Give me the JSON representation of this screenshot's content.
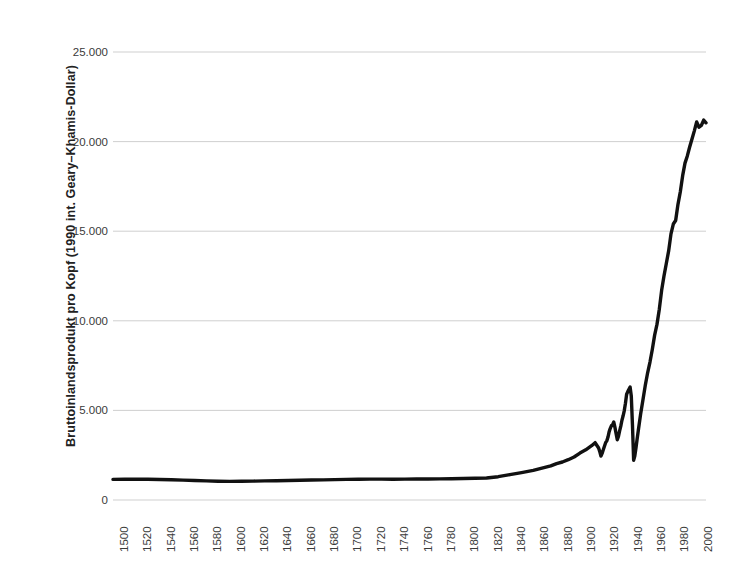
{
  "chart_data": {
    "type": "line",
    "title": "",
    "subtitle": "",
    "xlabel": "",
    "ylabel": "Bruttoinlandsprodukt pro Kopf (1990 int. Geary–Khamis-Dollar)",
    "ylim": [
      0,
      25000
    ],
    "xlim": [
      1500,
      2008
    ],
    "grid": "horizontal",
    "legend": "none",
    "y_tick_labels": [
      "0",
      "5.000",
      "10.000",
      "15.000",
      "20.000",
      "25.000"
    ],
    "y_tick_values": [
      0,
      5000,
      10000,
      15000,
      20000,
      25000
    ],
    "x_tick_labels": [
      "1500",
      "1520",
      "1540",
      "1560",
      "1580",
      "1600",
      "1620",
      "1640",
      "1660",
      "1680",
      "1700",
      "1720",
      "1740",
      "1760",
      "1780",
      "1800",
      "1820",
      "1840",
      "1860",
      "1880",
      "1900",
      "1920",
      "1940",
      "1960",
      "1980",
      "2000"
    ],
    "x_tick_values": [
      1500,
      1520,
      1540,
      1560,
      1580,
      1600,
      1620,
      1640,
      1660,
      1680,
      1700,
      1720,
      1740,
      1760,
      1780,
      1800,
      1820,
      1840,
      1860,
      1880,
      1900,
      1920,
      1940,
      1960,
      1980,
      2000
    ],
    "series": [
      {
        "name": "Bruttoinlandsprodukt pro Kopf",
        "color": "#111111",
        "x": [
          1500,
          1510,
          1520,
          1530,
          1540,
          1550,
          1560,
          1570,
          1580,
          1590,
          1600,
          1610,
          1620,
          1630,
          1640,
          1650,
          1660,
          1670,
          1680,
          1690,
          1700,
          1710,
          1720,
          1730,
          1740,
          1750,
          1760,
          1770,
          1780,
          1790,
          1800,
          1810,
          1820,
          1830,
          1840,
          1850,
          1860,
          1870,
          1875,
          1880,
          1885,
          1890,
          1895,
          1900,
          1905,
          1910,
          1913,
          1914,
          1915,
          1916,
          1917,
          1918,
          1919,
          1920,
          1921,
          1922,
          1923,
          1924,
          1925,
          1926,
          1927,
          1928,
          1929,
          1930,
          1931,
          1932,
          1933,
          1934,
          1935,
          1936,
          1937,
          1938,
          1939,
          1940,
          1941,
          1942,
          1943,
          1944,
          1945,
          1946,
          1947,
          1948,
          1949,
          1950,
          1952,
          1954,
          1956,
          1958,
          1960,
          1962,
          1964,
          1966,
          1968,
          1970,
          1972,
          1974,
          1976,
          1978,
          1980,
          1982,
          1984,
          1986,
          1988,
          1990,
          1992,
          1994,
          1996,
          1998,
          2000,
          2002,
          2004,
          2006,
          2008
        ],
        "y": [
          1150,
          1160,
          1160,
          1155,
          1145,
          1130,
          1110,
          1090,
          1070,
          1050,
          1040,
          1045,
          1055,
          1065,
          1075,
          1085,
          1100,
          1115,
          1125,
          1135,
          1150,
          1160,
          1165,
          1165,
          1160,
          1165,
          1170,
          1175,
          1180,
          1185,
          1200,
          1210,
          1230,
          1300,
          1420,
          1530,
          1650,
          1820,
          1900,
          2030,
          2120,
          2250,
          2400,
          2620,
          2800,
          3030,
          3200,
          3100,
          3000,
          2900,
          2700,
          2450,
          2600,
          2800,
          3000,
          3200,
          3300,
          3500,
          3800,
          4000,
          4150,
          4200,
          4350,
          4050,
          3700,
          3360,
          3550,
          3860,
          4120,
          4450,
          4700,
          4990,
          5400,
          5900,
          6050,
          6180,
          6300,
          5800,
          4200,
          2220,
          2450,
          2900,
          3400,
          3880,
          4800,
          5600,
          6400,
          7100,
          7700,
          8400,
          9200,
          9800,
          10650,
          11700,
          12500,
          13200,
          13900,
          14850,
          15400,
          15600,
          16500,
          17200,
          18100,
          18800,
          19200,
          19700,
          20150,
          20600,
          21100,
          20800,
          20900,
          21200,
          21050
        ]
      }
    ]
  },
  "axis": {
    "y_title": "Bruttoinlandsprodukt pro Kopf (1990 int. Geary–Khamis-Dollar)"
  }
}
